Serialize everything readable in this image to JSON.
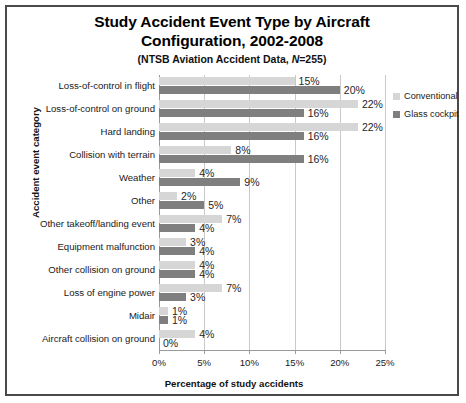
{
  "chart_data": {
    "type": "bar",
    "orientation": "horizontal",
    "title": "Study Accident Event Type by Aircraft Configuration, 2002-2008",
    "title_line1": "Study Accident Event Type by Aircraft",
    "title_line2": "Configuration, 2002-2008",
    "subtitle_prefix": "(NTSB Aviation Accident Data, ",
    "subtitle_italic": "N",
    "subtitle_suffix": "=255)",
    "xlabel": "Percentage of study accidents",
    "ylabel": "Accident event category",
    "xlim": [
      0,
      25
    ],
    "xtick_labels": [
      "0%",
      "5%",
      "10%",
      "15%",
      "20%",
      "25%"
    ],
    "xticks": [
      0,
      5,
      10,
      15,
      20,
      25
    ],
    "grid": true,
    "legend_position": "right",
    "categories": [
      "Loss-of-control in flight",
      "Loss-of-control on ground",
      "Hard landing",
      "Collision with terrain",
      "Weather",
      "Other",
      "Other takeoff/landing event",
      "Equipment malfunction",
      "Other collision on ground",
      "Loss of engine power",
      "Midair",
      "Aircraft collision on ground"
    ],
    "series": [
      {
        "name": "Conventional",
        "color": "#d6d6d6",
        "values": [
          15,
          22,
          22,
          8,
          4,
          2,
          7,
          3,
          4,
          7,
          1,
          4
        ],
        "labels": [
          "15%",
          "22%",
          "22%",
          "8%",
          "4%",
          "2%",
          "7%",
          "3%",
          "4%",
          "7%",
          "1%",
          "4%"
        ]
      },
      {
        "name": "Glass cockpit",
        "color": "#7f7f7f",
        "values": [
          20,
          16,
          16,
          16,
          9,
          5,
          4,
          4,
          4,
          3,
          1,
          0
        ],
        "labels": [
          "20%",
          "16%",
          "16%",
          "16%",
          "9%",
          "5%",
          "4%",
          "4%",
          "4%",
          "3%",
          "1%",
          "0%"
        ]
      }
    ]
  }
}
